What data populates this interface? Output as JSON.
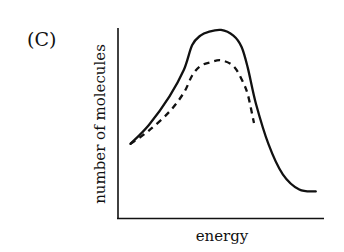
{
  "figure": {
    "panel_label": "(C)"
  },
  "chart_data": {
    "type": "line",
    "title": "",
    "panel_label": "(C)",
    "xlabel": "energy",
    "ylabel": "number of molecules",
    "grid": false,
    "legend": null,
    "x_ticks": [],
    "y_ticks": [],
    "xlim": [
      0,
      10
    ],
    "ylim": [
      0,
      10
    ],
    "series": [
      {
        "name": "solid curve",
        "style": "solid",
        "x": [
          0.6,
          1.5,
          2.5,
          3.2,
          3.6,
          4.0,
          4.4,
          5.0,
          5.6,
          6.0,
          6.3,
          6.7,
          7.3,
          8.0,
          8.8,
          9.6
        ],
        "y": [
          3.9,
          4.9,
          6.4,
          7.8,
          9.1,
          9.6,
          9.8,
          9.9,
          9.6,
          9.0,
          7.9,
          6.0,
          3.9,
          2.3,
          1.5,
          1.4
        ]
      },
      {
        "name": "dashed curve",
        "style": "dashed",
        "x": [
          0.6,
          1.5,
          2.5,
          3.2,
          3.6,
          4.0,
          4.5,
          5.0,
          5.6,
          6.0,
          6.3,
          6.6
        ],
        "y": [
          3.9,
          4.6,
          5.6,
          6.6,
          7.5,
          8.0,
          8.2,
          8.3,
          8.0,
          7.3,
          6.5,
          5.0
        ]
      }
    ],
    "annotations": []
  }
}
